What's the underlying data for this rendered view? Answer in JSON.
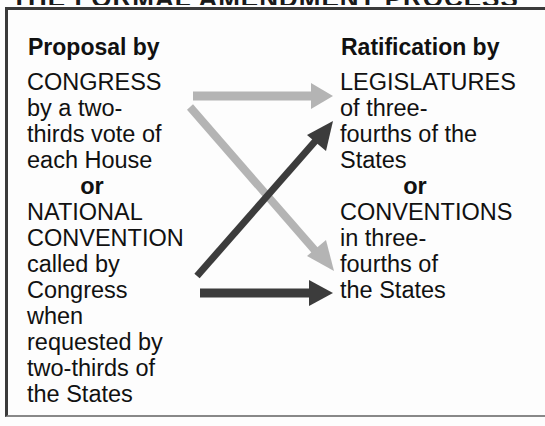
{
  "title": "THE FORMAL AMENDMENT PROCESS",
  "proposal": {
    "heading": "Proposal by",
    "lines": [
      "CONGRESS",
      "by a two-",
      "thirds vote of",
      "each House"
    ],
    "or_label": "or",
    "alt_lines": [
      "NATIONAL",
      "CONVENTION",
      "called by",
      "Congress",
      "when",
      "requested by",
      "two-thirds of",
      "the States"
    ]
  },
  "ratification": {
    "heading": "Ratification by",
    "lines": [
      "LEGISLATURES",
      "of three-",
      "fourths of the",
      "States"
    ],
    "or_label": "or",
    "alt_lines": [
      "CONVENTIONS",
      "in three-",
      "fourths of",
      "the States"
    ]
  },
  "arrows": [
    {
      "from": "CONGRESS",
      "to": "LEGISLATURES",
      "color": "#b4b4b4"
    },
    {
      "from": "CONGRESS",
      "to": "CONVENTIONS",
      "color": "#b4b4b4"
    },
    {
      "from": "NATIONAL CONVENTION",
      "to": "LEGISLATURES",
      "color": "#3c3c3c"
    },
    {
      "from": "NATIONAL CONVENTION",
      "to": "CONVENTIONS",
      "color": "#3c3c3c"
    }
  ],
  "colors": {
    "light_arrow": "#b4b4b4",
    "dark_arrow": "#3c3c3c",
    "border": "#3a3a3a"
  }
}
